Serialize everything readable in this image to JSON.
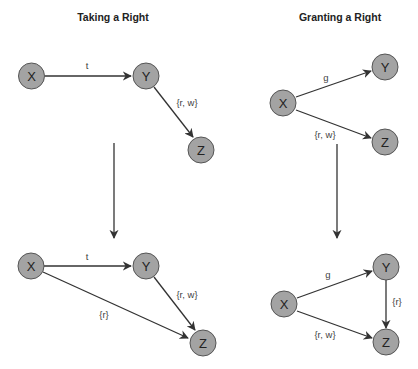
{
  "panels": {
    "taking": {
      "title": "Taking a Right",
      "before": {
        "nodes": {
          "x": "X",
          "y": "Y",
          "z": "Z"
        },
        "edges": {
          "xy": "t",
          "yz": "{r, w}"
        }
      },
      "after": {
        "nodes": {
          "x": "X",
          "y": "Y",
          "z": "Z"
        },
        "edges": {
          "xy": "t",
          "yz": "{r, w}",
          "xz": "{r}"
        }
      }
    },
    "granting": {
      "title": "Granting a Right",
      "before": {
        "nodes": {
          "x": "X",
          "y": "Y",
          "z": "Z"
        },
        "edges": {
          "xy": "g",
          "xz": "{r, w}"
        }
      },
      "after": {
        "nodes": {
          "x": "X",
          "y": "Y",
          "z": "Z"
        },
        "edges": {
          "xy": "g",
          "xz": "{r, w}",
          "yz": "{r}"
        }
      }
    }
  },
  "colors": {
    "node_fill": "#a3a3a3",
    "node_stroke": "#555555",
    "edge": "#333333",
    "background": "#ffffff"
  }
}
